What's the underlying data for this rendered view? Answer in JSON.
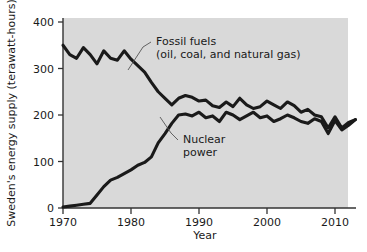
{
  "chart_data": {
    "type": "line",
    "title": "",
    "xlabel": "Year",
    "ylabel": "Sweden's energy supply (terawatt-hours)",
    "xlim": [
      1970,
      2013
    ],
    "ylim": [
      0,
      400
    ],
    "xticks": [
      "1970",
      "1980",
      "1990",
      "2000",
      "2010"
    ],
    "xtick_values": [
      1970,
      1980,
      1990,
      2000,
      2010
    ],
    "yticks": [
      "0",
      "100",
      "200",
      "300",
      "400"
    ],
    "ytick_values": [
      0,
      100,
      200,
      300,
      400
    ],
    "grid": false,
    "legend_position": "inline-annotations",
    "plot_background": "#d9d9d9",
    "line_color": "#1a1a1a",
    "x": [
      1970,
      1971,
      1972,
      1973,
      1974,
      1975,
      1976,
      1977,
      1978,
      1979,
      1980,
      1981,
      1982,
      1983,
      1984,
      1985,
      1986,
      1987,
      1988,
      1989,
      1990,
      1991,
      1992,
      1993,
      1994,
      1995,
      1996,
      1997,
      1998,
      1999,
      2000,
      2001,
      2002,
      2003,
      2004,
      2005,
      2006,
      2007,
      2008,
      2009,
      2010,
      2011,
      2012,
      2013
    ],
    "series": [
      {
        "name": "Fossil fuels",
        "label_lines": [
          "Fossil fuels",
          "(oil, coal, and natural gas)"
        ],
        "values": [
          350,
          330,
          322,
          345,
          330,
          310,
          338,
          322,
          318,
          338,
          320,
          306,
          292,
          270,
          250,
          236,
          222,
          236,
          242,
          238,
          230,
          232,
          220,
          216,
          228,
          218,
          236,
          222,
          214,
          218,
          230,
          222,
          214,
          228,
          220,
          206,
          212,
          200,
          196,
          172,
          196,
          172,
          184,
          190
        ]
      },
      {
        "name": "Nuclear power",
        "label_lines": [
          "Nuclear",
          "power"
        ],
        "values": [
          2,
          4,
          6,
          8,
          10,
          28,
          46,
          60,
          66,
          74,
          82,
          92,
          98,
          110,
          140,
          160,
          182,
          200,
          202,
          198,
          206,
          194,
          198,
          186,
          206,
          200,
          190,
          198,
          206,
          194,
          198,
          186,
          192,
          200,
          194,
          186,
          182,
          192,
          186,
          160,
          188,
          168,
          178,
          190
        ]
      }
    ],
    "annotations": [
      {
        "text": "Fossil fuels",
        "series": "Fossil fuels"
      },
      {
        "text": "(oil, coal, and natural gas)",
        "series": "Fossil fuels"
      },
      {
        "text": "Nuclear",
        "series": "Nuclear power"
      },
      {
        "text": "power",
        "series": "Nuclear power"
      }
    ]
  },
  "axes": {
    "x_axis_title": "Year",
    "y_axis_title": "Sweden's energy supply (terawatt-hours)",
    "x_tick_0": "1970",
    "x_tick_1": "1980",
    "x_tick_2": "1990",
    "x_tick_3": "2000",
    "x_tick_4": "2010",
    "y_tick_0": "0",
    "y_tick_1": "100",
    "y_tick_2": "200",
    "y_tick_3": "300",
    "y_tick_4": "400"
  },
  "labels": {
    "fossil_line1": "Fossil fuels",
    "fossil_line2": "(oil, coal, and natural gas)",
    "nuclear_line1": "Nuclear",
    "nuclear_line2": "power"
  }
}
